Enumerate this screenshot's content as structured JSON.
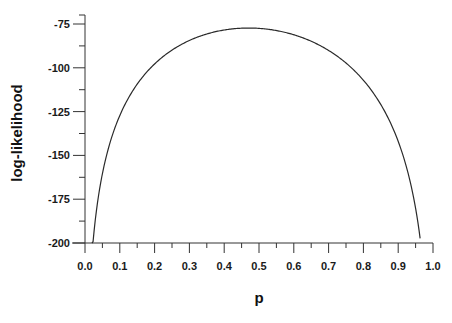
{
  "chart_data": {
    "type": "line",
    "title": "",
    "xlabel": "p",
    "ylabel": "log-likelihood",
    "xlim": [
      0.0,
      1.0
    ],
    "ylim": [
      -200,
      -75
    ],
    "xticks": [
      "0.0",
      "0.1",
      "0.2",
      "0.3",
      "0.4",
      "0.5",
      "0.6",
      "0.7",
      "0.8",
      "0.9",
      "1.0"
    ],
    "yticks": [
      "-75",
      "-100",
      "-125",
      "-150",
      "-175",
      "-200"
    ],
    "grid": false,
    "legend": null,
    "series": [
      {
        "name": "log-likelihood",
        "x": [
          0.02,
          0.03,
          0.04,
          0.05,
          0.07,
          0.1,
          0.13,
          0.16,
          0.2,
          0.25,
          0.3,
          0.35,
          0.4,
          0.45,
          0.47,
          0.5,
          0.55,
          0.6,
          0.65,
          0.7,
          0.75,
          0.8,
          0.84,
          0.87,
          0.9,
          0.92,
          0.94,
          0.95,
          0.963
        ],
        "y": [
          -200,
          -185,
          -171,
          -160,
          -144,
          -126,
          -114,
          -105,
          -96,
          -88,
          -83,
          -79.6,
          -78,
          -77.4,
          -77.3,
          -77.5,
          -79,
          -82,
          -86,
          -91,
          -98,
          -107,
          -117,
          -126,
          -138,
          -150,
          -166,
          -176,
          -198
        ]
      }
    ],
    "peak": {
      "x": 0.47,
      "y": -77.3
    }
  }
}
